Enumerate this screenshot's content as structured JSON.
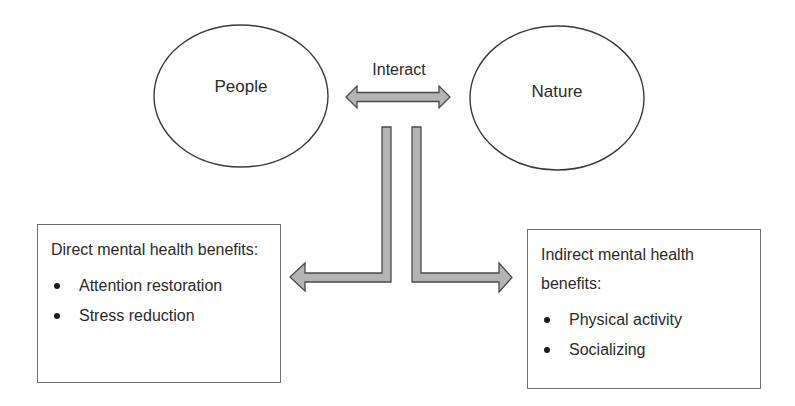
{
  "diagram": {
    "nodes": {
      "people": {
        "label": "People"
      },
      "nature": {
        "label": "Nature"
      }
    },
    "interaction_arrow": {
      "label": "Interact",
      "direction": "bidirectional"
    },
    "boxes": {
      "direct": {
        "title": "Direct mental health benefits:",
        "items": [
          "Attention restoration",
          "Stress reduction"
        ]
      },
      "indirect": {
        "title": "Indirect mental health benefits:",
        "items": [
          "Physical activity",
          "Socializing"
        ]
      }
    },
    "colors": {
      "outline": "#3a3a3a",
      "arrow_fill": "#b4b4b4",
      "arrow_stroke": "#4a4a4a",
      "box_border": "#6e6e6e",
      "text": "#2b2b2b"
    }
  }
}
